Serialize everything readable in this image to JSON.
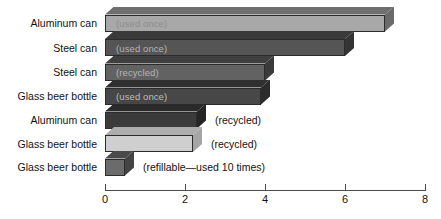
{
  "chart_data": {
    "type": "bar",
    "orientation": "horizontal",
    "title": "",
    "subtitle": "",
    "xlabel": "",
    "ylabel": "",
    "xlim": [
      0,
      8
    ],
    "ylim": null,
    "grid": false,
    "legend": null,
    "xticks": [
      "0",
      "2",
      "4",
      "6",
      "8"
    ],
    "xtick_values": [
      0,
      2,
      4,
      6,
      8
    ],
    "categories": [
      "Aluminum can",
      "Steel can",
      "Steel can",
      "Glass beer bottle",
      "Aluminum can",
      "Glass beer bottle",
      "Glass beer bottle"
    ],
    "values": [
      7.0,
      6.0,
      4.0,
      3.9,
      2.3,
      2.2,
      0.5
    ],
    "annotations": [
      "(used once)",
      "(used once)",
      "(recycled)",
      "(used once)",
      "(recycled)",
      "(recycled)",
      "(refillable—used 10 times)"
    ],
    "bars": [
      {
        "category": "Aluminum can",
        "note": "(used once)",
        "value": 7.0,
        "note_inside": true,
        "note_color": "#8d8d8d",
        "face_color": "#a8a8a8",
        "top_color": "#6f6f6f",
        "side_color": "#6a6a6a"
      },
      {
        "category": "Steel can",
        "note": "(used once)",
        "value": 6.0,
        "note_inside": true,
        "note_color": "#b4b4b4",
        "face_color": "#555555",
        "top_color": "#3a3a3a",
        "side_color": "#343434"
      },
      {
        "category": "Steel can",
        "note": "(recycled)",
        "value": 4.0,
        "note_inside": true,
        "note_color": "#b7b7b7",
        "face_color": "#626262",
        "top_color": "#3f3f3f",
        "side_color": "#3a3a3a"
      },
      {
        "category": "Glass beer bottle",
        "note": "(used once)",
        "value": 3.9,
        "note_inside": true,
        "note_color": "#bdbdbd",
        "face_color": "#474747",
        "top_color": "#303030",
        "side_color": "#2b2b2b"
      },
      {
        "category": "Aluminum can",
        "note": "(recycled)",
        "value": 2.3,
        "note_inside": false,
        "note_color": "#111111",
        "face_color": "#3b3b3b",
        "top_color": "#2a2a2a",
        "side_color": "#252525"
      },
      {
        "category": "Glass beer bottle",
        "note": "(recycled)",
        "value": 2.2,
        "note_inside": false,
        "note_color": "#111111",
        "face_color": "#cfcfcf",
        "top_color": "#adadad",
        "side_color": "#a5a5a5"
      },
      {
        "category": "Glass beer bottle",
        "note": "(refillable—used 10 times)",
        "value": 0.5,
        "note_inside": false,
        "note_color": "#111111",
        "face_color": "#6b6b6b",
        "top_color": "#4a4a4a",
        "side_color": "#444444"
      }
    ],
    "colors": {
      "axis": "#4a4a4a",
      "text": "#111111",
      "background": "#ffffff"
    }
  }
}
